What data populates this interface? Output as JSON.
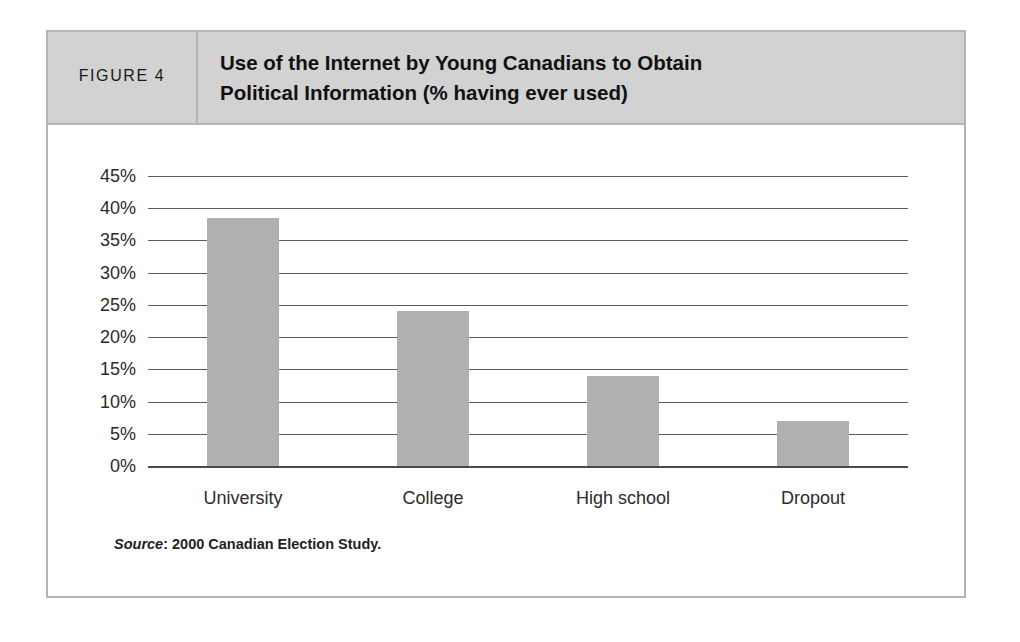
{
  "figure": {
    "number_label": "FIGURE 4",
    "title_lines": [
      "Use of the Internet by Young Canadians to Obtain",
      "Political Information (% having ever used)"
    ],
    "source_label": "Source",
    "source_text": ": 2000 Canadian Election Study."
  },
  "colors": {
    "bar_fill": "#b0b0b0",
    "header_band": "#d2d2d2",
    "frame_border": "#b4b4b4",
    "gridline": "#5b5b5b",
    "text": "#2b2b2b"
  },
  "chart_data": {
    "type": "bar",
    "title": "Use of the Internet by Young Canadians to Obtain Political Information (% having ever used)",
    "xlabel": "",
    "ylabel": "",
    "categories": [
      "University",
      "College",
      "High school",
      "Dropout"
    ],
    "values": [
      38.5,
      24,
      14,
      7
    ],
    "ylim": [
      0,
      45
    ],
    "ytick_labels": [
      "45%",
      "40%",
      "35%",
      "30%",
      "25%",
      "20%",
      "15%",
      "10%",
      "5%",
      "0%"
    ],
    "ytick_values": [
      45,
      40,
      35,
      30,
      25,
      20,
      15,
      10,
      5,
      0
    ],
    "grid": true,
    "legend": false,
    "source": "Source: 2000 Canadian Election Study."
  }
}
